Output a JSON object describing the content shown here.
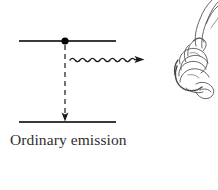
{
  "figure": {
    "caption": "Ordinary emission",
    "width": 218,
    "height": 190,
    "background_color": "#ffffff",
    "ink_color": "#3a3a3a",
    "sketch_color": "#4a4a4a"
  },
  "diagram": {
    "type": "energy-level-transition",
    "upper_level": {
      "label": "upper energy level",
      "x1": 19,
      "x2": 116,
      "y": 41,
      "stroke_width": 2,
      "color": "#3a3a3a"
    },
    "lower_level": {
      "label": "lower energy level",
      "x1": 19,
      "x2": 116,
      "y": 122,
      "stroke_width": 2,
      "color": "#3a3a3a"
    },
    "vertex_dot": {
      "label": "interaction vertex",
      "cx": 65,
      "cy": 41,
      "r": 3.6,
      "color": "#000000"
    },
    "transition_arrow": {
      "label": "downward transition",
      "style": "dashed",
      "x": 65,
      "y1": 45,
      "y2": 121,
      "dash": "5 4",
      "stroke_width": 1.4,
      "color": "#3a3a3a"
    },
    "photon_arrow": {
      "label": "emitted photon",
      "style": "wavy",
      "x_start": 70,
      "x_end": 144,
      "y": 60,
      "amplitude": 2.6,
      "wavelength": 10,
      "cycles": 7,
      "stroke_width": 1.3,
      "color": "#1a1a1a"
    }
  },
  "sketch": {
    "name": "hand-drawing",
    "description": "pencil sketch of a pointing hand, cropped at right edge",
    "x": 172,
    "y": 0,
    "width": 46,
    "height": 92,
    "color": "#4a4a4a"
  }
}
